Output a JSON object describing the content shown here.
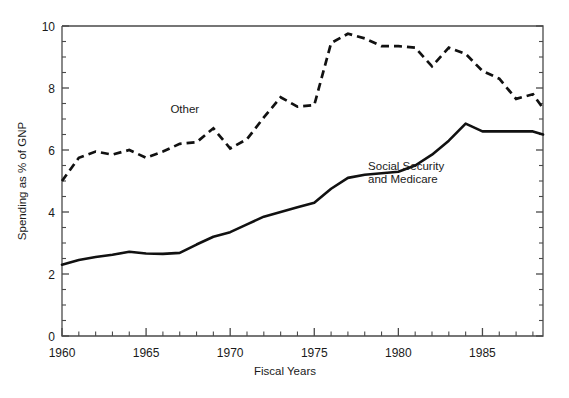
{
  "chart_data": {
    "type": "line",
    "title": "",
    "xlabel": "Fiscal Years",
    "ylabel": "Spending as % of GNP",
    "xlim": [
      1960,
      1988.6
    ],
    "ylim": [
      0,
      10
    ],
    "grid": false,
    "legend": "inline-annotations",
    "x_major_ticks": [
      1960,
      1965,
      1970,
      1975,
      1980,
      1985
    ],
    "x_major_tick_labels": [
      "1960",
      "1965",
      "1970",
      "1975",
      "1980",
      "1985"
    ],
    "x_minor_tick_interval": 1,
    "y_major_ticks": [
      0,
      2,
      4,
      6,
      8,
      10
    ],
    "y_major_tick_labels": [
      "0",
      "2",
      "4",
      "6",
      "8",
      "10"
    ],
    "y_minor_tick_interval": 0.5,
    "x": [
      1960,
      1961,
      1962,
      1963,
      1964,
      1965,
      1966,
      1967,
      1968,
      1969,
      1970,
      1971,
      1972,
      1973,
      1974,
      1975,
      1976,
      1977,
      1978,
      1979,
      1980,
      1981,
      1982,
      1983,
      1984,
      1985,
      1986,
      1987,
      1988,
      1988.6
    ],
    "series": [
      {
        "name": "Other",
        "style": "dashed",
        "label_text": "Other",
        "values": [
          5.0,
          5.75,
          5.95,
          5.85,
          6.0,
          5.75,
          5.95,
          6.2,
          6.25,
          6.7,
          6.05,
          6.35,
          7.05,
          7.7,
          7.4,
          7.45,
          9.45,
          9.75,
          9.6,
          9.35,
          9.35,
          9.3,
          8.7,
          9.3,
          9.1,
          8.55,
          8.3,
          7.65,
          7.8,
          7.35
        ]
      },
      {
        "name": "Social Security and Medicare",
        "style": "solid",
        "label_text": "Social Security\nand Medicare",
        "label_line1": "Social Security",
        "label_line2": "and Medicare",
        "values": [
          2.3,
          2.45,
          2.55,
          2.62,
          2.72,
          2.66,
          2.65,
          2.68,
          2.95,
          3.2,
          3.35,
          3.6,
          3.85,
          4.0,
          4.15,
          4.3,
          4.75,
          5.1,
          5.2,
          5.25,
          5.3,
          5.5,
          5.85,
          6.3,
          6.85,
          6.6,
          6.6,
          6.6,
          6.6,
          6.5
        ]
      }
    ],
    "annotations": [
      {
        "text": "Other",
        "x": 1967.3,
        "y": 7.2,
        "series": "Other"
      },
      {
        "text": "Social Security",
        "x": 1978.2,
        "y": 5.35,
        "series": "Social Security and Medicare"
      },
      {
        "text": "and Medicare",
        "x": 1978.2,
        "y": 4.95,
        "series": "Social Security and Medicare"
      }
    ],
    "colors": {
      "line": "#111111",
      "frame": "#4a4a4a",
      "text": "#1a1a1a",
      "background": "#ffffff"
    }
  }
}
